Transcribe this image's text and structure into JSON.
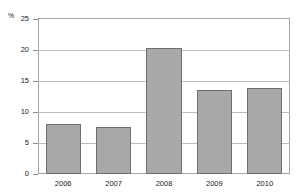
{
  "top_caption": "",
  "chart_data": {
    "type": "bar",
    "title": "",
    "xlabel": "",
    "ylabel": "%",
    "unit_label": "%",
    "categories": [
      "2006",
      "2007",
      "2008",
      "2009",
      "2010"
    ],
    "values": [
      8.0,
      7.6,
      20.3,
      13.5,
      13.8
    ],
    "ylim": [
      0,
      25
    ],
    "yticks": [
      0,
      5,
      10,
      15,
      20,
      25
    ],
    "ytick_labels": [
      "0",
      "5",
      "10",
      "15",
      "20",
      "25"
    ],
    "grid": true,
    "grid_axis": "y",
    "legend": false,
    "bar_color": "#a8a8a8",
    "bar_edge_color": "#6e6e6e",
    "grid_color": "#bdbdbd",
    "frame_color": "#a6a6a6"
  }
}
